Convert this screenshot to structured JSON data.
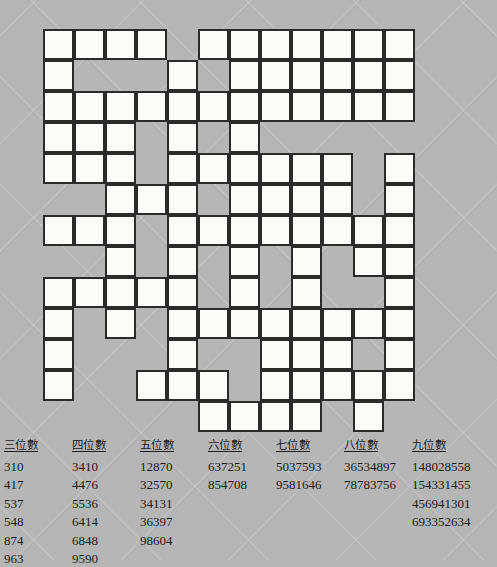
{
  "puzzle": {
    "title": "Number Fill-In Crossword",
    "grid": {
      "columns": 12,
      "rows": 13,
      "cell_size_px": 31,
      "origin_x_px": 43,
      "origin_y_px": 29,
      "cell_fill_color": "#fbfbfa",
      "cell_border_color": "#2b2b2b",
      "background_color": "#b6b6b6",
      "open_cells": [
        [
          0,
          0
        ],
        [
          0,
          1
        ],
        [
          0,
          2
        ],
        [
          0,
          3
        ],
        [
          0,
          5
        ],
        [
          0,
          6
        ],
        [
          0,
          7
        ],
        [
          0,
          8
        ],
        [
          0,
          9
        ],
        [
          0,
          10
        ],
        [
          0,
          11
        ],
        [
          1,
          0
        ],
        [
          1,
          4
        ],
        [
          1,
          6
        ],
        [
          1,
          7
        ],
        [
          1,
          8
        ],
        [
          1,
          9
        ],
        [
          1,
          10
        ],
        [
          1,
          11
        ],
        [
          2,
          0
        ],
        [
          2,
          1
        ],
        [
          2,
          2
        ],
        [
          2,
          3
        ],
        [
          2,
          4
        ],
        [
          2,
          5
        ],
        [
          2,
          6
        ],
        [
          2,
          7
        ],
        [
          2,
          8
        ],
        [
          2,
          9
        ],
        [
          2,
          10
        ],
        [
          2,
          11
        ],
        [
          3,
          0
        ],
        [
          3,
          1
        ],
        [
          3,
          2
        ],
        [
          3,
          4
        ],
        [
          3,
          6
        ],
        [
          4,
          0
        ],
        [
          4,
          1
        ],
        [
          4,
          2
        ],
        [
          4,
          4
        ],
        [
          4,
          5
        ],
        [
          4,
          6
        ],
        [
          4,
          7
        ],
        [
          4,
          8
        ],
        [
          4,
          9
        ],
        [
          4,
          11
        ],
        [
          5,
          2
        ],
        [
          5,
          3
        ],
        [
          5,
          4
        ],
        [
          5,
          6
        ],
        [
          5,
          7
        ],
        [
          5,
          8
        ],
        [
          5,
          9
        ],
        [
          5,
          11
        ],
        [
          6,
          0
        ],
        [
          6,
          1
        ],
        [
          6,
          2
        ],
        [
          6,
          4
        ],
        [
          6,
          5
        ],
        [
          6,
          6
        ],
        [
          6,
          7
        ],
        [
          6,
          8
        ],
        [
          6,
          9
        ],
        [
          6,
          10
        ],
        [
          6,
          11
        ],
        [
          7,
          2
        ],
        [
          7,
          4
        ],
        [
          7,
          6
        ],
        [
          7,
          8
        ],
        [
          7,
          10
        ],
        [
          7,
          11
        ],
        [
          8,
          0
        ],
        [
          8,
          1
        ],
        [
          8,
          2
        ],
        [
          8,
          3
        ],
        [
          8,
          4
        ],
        [
          8,
          6
        ],
        [
          8,
          8
        ],
        [
          8,
          11
        ],
        [
          9,
          0
        ],
        [
          9,
          2
        ],
        [
          9,
          4
        ],
        [
          9,
          5
        ],
        [
          9,
          6
        ],
        [
          9,
          7
        ],
        [
          9,
          8
        ],
        [
          9,
          9
        ],
        [
          9,
          10
        ],
        [
          9,
          11
        ],
        [
          10,
          0
        ],
        [
          10,
          4
        ],
        [
          10,
          7
        ],
        [
          10,
          8
        ],
        [
          10,
          9
        ],
        [
          10,
          11
        ],
        [
          11,
          0
        ],
        [
          11,
          3
        ],
        [
          11,
          4
        ],
        [
          11,
          5
        ],
        [
          11,
          7
        ],
        [
          11,
          8
        ],
        [
          11,
          9
        ],
        [
          11,
          10
        ],
        [
          11,
          11
        ],
        [
          12,
          5
        ],
        [
          12,
          6
        ],
        [
          12,
          7
        ],
        [
          12,
          8
        ],
        [
          12,
          10
        ]
      ]
    }
  },
  "word_lists": [
    {
      "heading": "三位數",
      "left_px": 4,
      "entries": [
        "310",
        "417",
        "537",
        "548",
        "874",
        "963"
      ]
    },
    {
      "heading": "四位數",
      "left_px": 72,
      "entries": [
        "3410",
        "4476",
        "5536",
        "6414",
        "6848",
        "9590"
      ]
    },
    {
      "heading": "五位數",
      "left_px": 140,
      "entries": [
        "12870",
        "32570",
        "34131",
        "36397",
        "98604"
      ]
    },
    {
      "heading": "六位數",
      "left_px": 208,
      "entries": [
        "637251",
        "854708"
      ]
    },
    {
      "heading": "七位數",
      "left_px": 276,
      "entries": [
        "5037593",
        "9581646"
      ]
    },
    {
      "heading": "八位數",
      "left_px": 344,
      "entries": [
        "36534897",
        "78783756"
      ]
    },
    {
      "heading": "九位數",
      "left_px": 412,
      "entries": [
        "148028558",
        "154331455",
        "456941301",
        "693352634"
      ]
    }
  ]
}
